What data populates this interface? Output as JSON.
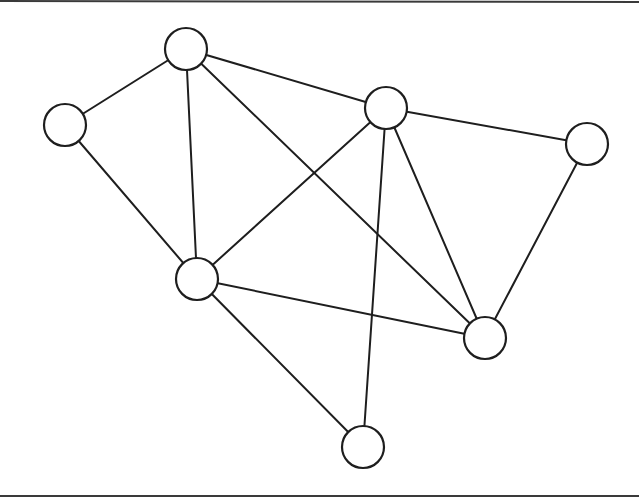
{
  "diagram": {
    "type": "undirected-graph",
    "width": 639,
    "height": 502,
    "colors": {
      "background": "#ffffff",
      "stroke": "#1e1e1e",
      "node_fill": "#ffffff",
      "border": "#3a3a3a"
    },
    "border_lines": [
      {
        "id": "top-rule",
        "x1": 0,
        "y1": 1,
        "x2": 639,
        "y2": 2
      },
      {
        "id": "bottom-rule",
        "x1": 0,
        "y1": 496,
        "x2": 639,
        "y2": 496
      }
    ],
    "node_radius": 21,
    "nodes": [
      {
        "id": "A",
        "x": 186,
        "y": 49
      },
      {
        "id": "B",
        "x": 65,
        "y": 125
      },
      {
        "id": "C",
        "x": 386,
        "y": 108
      },
      {
        "id": "D",
        "x": 587,
        "y": 144
      },
      {
        "id": "E",
        "x": 197,
        "y": 279
      },
      {
        "id": "F",
        "x": 485,
        "y": 338
      },
      {
        "id": "G",
        "x": 363,
        "y": 447
      }
    ],
    "edges": [
      {
        "from": "A",
        "to": "B"
      },
      {
        "from": "A",
        "to": "C"
      },
      {
        "from": "A",
        "to": "E"
      },
      {
        "from": "A",
        "to": "F"
      },
      {
        "from": "B",
        "to": "E"
      },
      {
        "from": "C",
        "to": "D"
      },
      {
        "from": "C",
        "to": "E"
      },
      {
        "from": "C",
        "to": "F"
      },
      {
        "from": "C",
        "to": "G"
      },
      {
        "from": "D",
        "to": "F"
      },
      {
        "from": "E",
        "to": "F"
      },
      {
        "from": "E",
        "to": "G"
      }
    ]
  }
}
